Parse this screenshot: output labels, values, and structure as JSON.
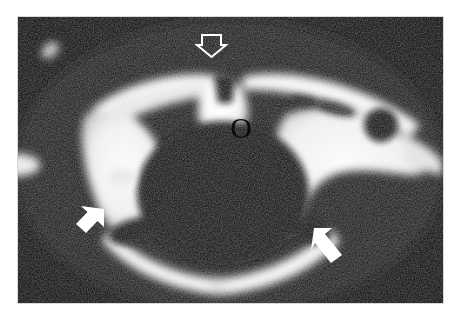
{
  "figure": {
    "modality": "CT",
    "view": "axial",
    "plate_background": "#0a0a0a",
    "page_background": "#ffffff",
    "annotation_color": "#ffffff",
    "label_color": "#0b0b0b"
  },
  "annotations": {
    "open_arrow": {
      "name": "open-arrow-marker",
      "style": "hollow-outline",
      "direction": "down",
      "x": 180,
      "y": 18,
      "width": 27,
      "height": 20
    },
    "letter_label": {
      "name": "letter-label-o",
      "text": "O",
      "x": 206,
      "y": 96
    },
    "left_solid_arrow": {
      "name": "solid-arrow-left",
      "style": "solid-filled",
      "direction": "up-right",
      "x": 48,
      "y": 192,
      "width": 38,
      "height": 28
    },
    "right_solid_arrow": {
      "name": "solid-arrow-right",
      "style": "solid-filled",
      "direction": "up-left",
      "x": 294,
      "y": 210,
      "width": 38,
      "height": 33
    }
  },
  "structures": {
    "central_oval": {
      "name": "central-bright-oval",
      "cx": 223,
      "cy": 111,
      "rx": 27,
      "ry": 36
    },
    "left_lamina": {
      "name": "left-bright-lamina"
    },
    "right_lamina": {
      "name": "right-bright-lamina"
    },
    "right_dark_foramen": {
      "name": "right-dark-foramen",
      "cx": 363,
      "cy": 108,
      "r": 17
    },
    "posterior_arc": {
      "name": "posterior-bright-arc"
    },
    "upper_left_nodule": {
      "name": "upper-left-bright-nodule",
      "cx": 32,
      "cy": 33
    },
    "left_margin_blob": {
      "name": "left-margin-bright-blob",
      "cx": 4,
      "cy": 148
    }
  }
}
